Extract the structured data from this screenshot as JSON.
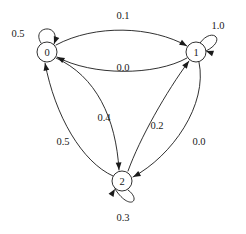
{
  "diagram": {
    "kind": "state-transition-diagram",
    "title": "",
    "background_color": "#ffffff",
    "stroke_color": "#1a1a1a",
    "nodes": [
      {
        "id": "0",
        "label": "0",
        "cx": 47,
        "cy": 52,
        "r": 10
      },
      {
        "id": "1",
        "label": "1",
        "cx": 196,
        "cy": 52,
        "r": 10
      },
      {
        "id": "2",
        "label": "2",
        "cx": 122,
        "cy": 181,
        "r": 10
      }
    ],
    "self_loops": [
      {
        "node": "0",
        "label": "0.5",
        "label_x": 18,
        "label_y": 33,
        "path": "M 41 43 C 30 26, 62 22, 54 44",
        "arrow_x": 54,
        "arrow_y": 44,
        "arrow_angle": 110
      },
      {
        "node": "1",
        "label": "1.0",
        "label_x": 218,
        "label_y": 25,
        "path": "M 200 43 C 212 26, 228 40, 206 51",
        "arrow_x": 206,
        "arrow_y": 51,
        "arrow_angle": 200
      },
      {
        "node": "2",
        "label": "0.3",
        "label_x": 123,
        "label_y": 217,
        "path": "M 128 190 C 142 200, 130 212, 115 189",
        "arrow_x": 115,
        "arrow_y": 189,
        "arrow_angle": 302
      }
    ],
    "edges": [
      {
        "from": "0",
        "to": "1",
        "label": "0.1",
        "label_x": 123,
        "label_y": 15,
        "path": "M 56 45 C 95 24, 152 26, 187 46",
        "arrow_x": 187,
        "arrow_y": 46,
        "arrow_angle": 30
      },
      {
        "from": "1",
        "to": "0",
        "label": "0.0",
        "label_x": 123,
        "label_y": 67,
        "path": "M 187 58 C 155 76, 92 76, 57 57",
        "arrow_x": 57,
        "arrow_y": 57,
        "arrow_angle": 208
      },
      {
        "from": "0",
        "to": "2",
        "label": "0.4",
        "label_x": 104,
        "label_y": 117,
        "path": "M 56 58 C 96 76, 116 118, 119 170",
        "arrow_x": 119,
        "arrow_y": 170,
        "arrow_angle": 87
      },
      {
        "from": "2",
        "to": "0",
        "label": "0.5",
        "label_x": 63,
        "label_y": 141,
        "path": "M 113 176 C 82 162, 55 116, 45 63",
        "arrow_x": 45,
        "arrow_y": 63,
        "arrow_angle": 259
      },
      {
        "from": "2",
        "to": "1",
        "label": "0.2",
        "label_x": 157,
        "label_y": 125,
        "path": "M 128 171 C 140 138, 166 92, 189 61",
        "arrow_x": 189,
        "arrow_y": 61,
        "arrow_angle": 307
      },
      {
        "from": "1",
        "to": "2",
        "label": "0.0",
        "label_x": 199,
        "label_y": 141,
        "path": "M 199 62 C 208 105, 172 156, 133 177",
        "arrow_x": 133,
        "arrow_y": 177,
        "arrow_angle": 152
      }
    ]
  }
}
